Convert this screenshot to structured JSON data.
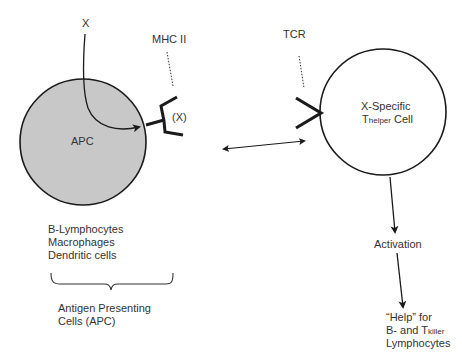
{
  "diagram": {
    "antigen_label": "X",
    "mhc_label": "MHC II",
    "bound_antigen_label": "(X)",
    "apc_label": "APC",
    "tcr_label": "TCR",
    "helper_cell": {
      "line1": "X-Specific",
      "prefix": "T",
      "subscript": "helper",
      "suffix": " Cell"
    },
    "apc_types": [
      "B-Lymphocytes",
      "Macrophages",
      "Dendritic cells"
    ],
    "apc_group_label": [
      "Antigen Presenting",
      "Cells (APC)"
    ],
    "activation_label": "Activation",
    "help_text": {
      "line1": "“Help” for",
      "line2_prefix": "B- and T",
      "line2_subscript": "killer",
      "line3": "Lymphocytes"
    },
    "colors": {
      "apc_fill": "#c8c8c8",
      "stroke": "#1a1a1a",
      "text": "#333333"
    }
  }
}
